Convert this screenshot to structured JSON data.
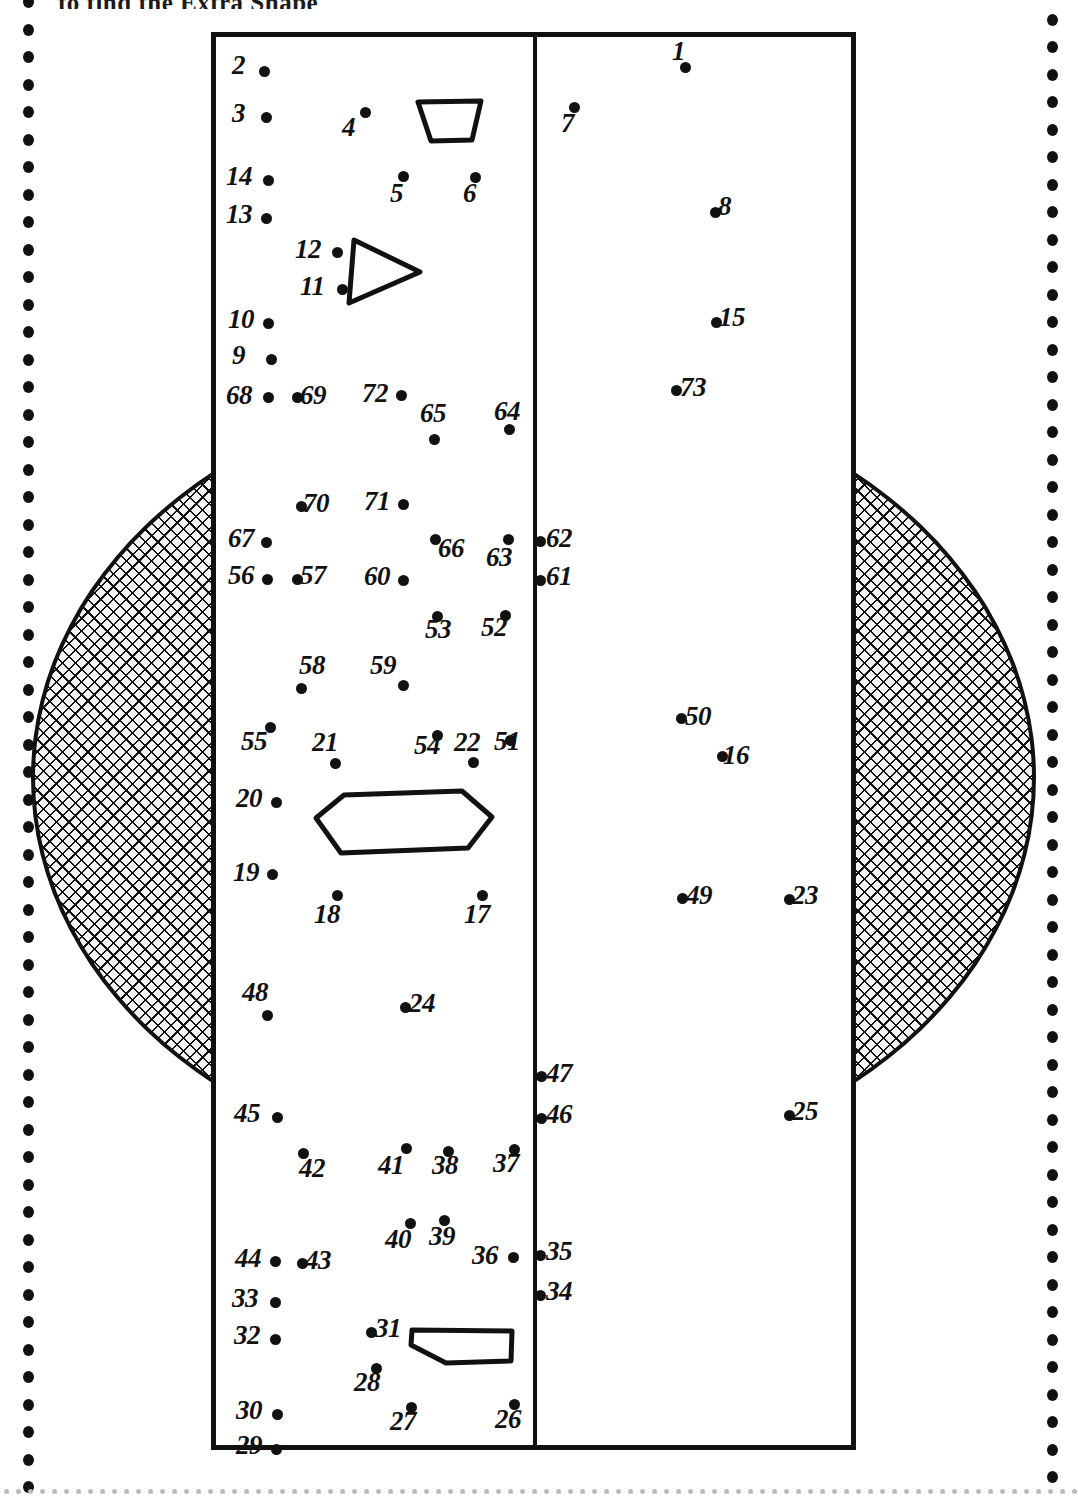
{
  "page": {
    "top_partial_heading": "to find the Extra Shape",
    "ink_color": "#111111",
    "paper_color": "#ffffff",
    "hatch_fill_color": "#f4f4f4"
  },
  "puzzle": {
    "type": "connect-the-dots",
    "frame": {
      "x": 211,
      "y": 32,
      "width": 645,
      "height": 1418,
      "divider_x": 533
    },
    "hatched_ellipse": {
      "cx": 533,
      "cy": 778,
      "rx": 503,
      "ry": 398
    },
    "dot_count": 73,
    "dots": [
      {
        "n": "1",
        "px": 680,
        "py": 62,
        "lx": 672,
        "ly": 36
      },
      {
        "n": "2",
        "px": 259,
        "py": 66,
        "lx": 232,
        "ly": 50
      },
      {
        "n": "3",
        "px": 261,
        "py": 112,
        "lx": 232,
        "ly": 98
      },
      {
        "n": "4",
        "px": 360,
        "py": 107,
        "lx": 342,
        "ly": 112
      },
      {
        "n": "5",
        "px": 398,
        "py": 171,
        "lx": 390,
        "ly": 178
      },
      {
        "n": "6",
        "px": 470,
        "py": 172,
        "lx": 463,
        "ly": 178
      },
      {
        "n": "7",
        "px": 569,
        "py": 102,
        "lx": 561,
        "ly": 108
      },
      {
        "n": "8",
        "px": 710,
        "py": 207,
        "lx": 718,
        "ly": 191
      },
      {
        "n": "9",
        "px": 266,
        "py": 354,
        "lx": 232,
        "ly": 340
      },
      {
        "n": "10",
        "px": 263,
        "py": 318,
        "lx": 228,
        "ly": 304
      },
      {
        "n": "11",
        "px": 337,
        "py": 284,
        "lx": 300,
        "ly": 271
      },
      {
        "n": "12",
        "px": 332,
        "py": 247,
        "lx": 295,
        "ly": 234
      },
      {
        "n": "13",
        "px": 261,
        "py": 213,
        "lx": 226,
        "ly": 199
      },
      {
        "n": "14",
        "px": 263,
        "py": 175,
        "lx": 226,
        "ly": 161
      },
      {
        "n": "15",
        "px": 711,
        "py": 317,
        "lx": 719,
        "ly": 302
      },
      {
        "n": "16",
        "px": 717,
        "py": 751,
        "lx": 723,
        "ly": 740
      },
      {
        "n": "17",
        "px": 477,
        "py": 890,
        "lx": 464,
        "ly": 899
      },
      {
        "n": "18",
        "px": 332,
        "py": 890,
        "lx": 314,
        "ly": 899
      },
      {
        "n": "19",
        "px": 267,
        "py": 869,
        "lx": 233,
        "ly": 857
      },
      {
        "n": "20",
        "px": 271,
        "py": 797,
        "lx": 236,
        "ly": 783
      },
      {
        "n": "21",
        "px": 330,
        "py": 758,
        "lx": 312,
        "ly": 727
      },
      {
        "n": "22",
        "px": 468,
        "py": 757,
        "lx": 454,
        "ly": 727
      },
      {
        "n": "23",
        "px": 784,
        "py": 894,
        "lx": 792,
        "ly": 880
      },
      {
        "n": "24",
        "px": 400,
        "py": 1002,
        "lx": 409,
        "ly": 988
      },
      {
        "n": "25",
        "px": 784,
        "py": 1110,
        "lx": 792,
        "ly": 1096
      },
      {
        "n": "26",
        "px": 509,
        "py": 1399,
        "lx": 495,
        "ly": 1404
      },
      {
        "n": "27",
        "px": 406,
        "py": 1402,
        "lx": 390,
        "ly": 1406
      },
      {
        "n": "28",
        "px": 371,
        "py": 1363,
        "lx": 354,
        "ly": 1367
      },
      {
        "n": "29",
        "px": 271,
        "py": 1444,
        "lx": 236,
        "ly": 1430
      },
      {
        "n": "30",
        "px": 272,
        "py": 1409,
        "lx": 236,
        "ly": 1395
      },
      {
        "n": "31",
        "px": 366,
        "py": 1327,
        "lx": 375,
        "ly": 1313
      },
      {
        "n": "32",
        "px": 270,
        "py": 1334,
        "lx": 234,
        "ly": 1320
      },
      {
        "n": "33",
        "px": 270,
        "py": 1297,
        "lx": 232,
        "ly": 1283
      },
      {
        "n": "34",
        "px": 535,
        "py": 1290,
        "lx": 546,
        "ly": 1276
      },
      {
        "n": "35",
        "px": 535,
        "py": 1250,
        "lx": 546,
        "ly": 1236
      },
      {
        "n": "36",
        "px": 508,
        "py": 1252,
        "lx": 472,
        "ly": 1240
      },
      {
        "n": "37",
        "px": 509,
        "py": 1144,
        "lx": 493,
        "ly": 1148
      },
      {
        "n": "38",
        "px": 443,
        "py": 1146,
        "lx": 432,
        "ly": 1150
      },
      {
        "n": "39",
        "px": 439,
        "py": 1215,
        "lx": 429,
        "ly": 1221
      },
      {
        "n": "40",
        "px": 405,
        "py": 1218,
        "lx": 385,
        "ly": 1224
      },
      {
        "n": "41",
        "px": 401,
        "py": 1143,
        "lx": 378,
        "ly": 1150
      },
      {
        "n": "42",
        "px": 298,
        "py": 1148,
        "lx": 299,
        "ly": 1153
      },
      {
        "n": "43",
        "px": 297,
        "py": 1258,
        "lx": 305,
        "ly": 1245
      },
      {
        "n": "44",
        "px": 270,
        "py": 1256,
        "lx": 235,
        "ly": 1243
      },
      {
        "n": "45",
        "px": 272,
        "py": 1112,
        "lx": 234,
        "ly": 1098
      },
      {
        "n": "46",
        "px": 536,
        "py": 1113,
        "lx": 546,
        "ly": 1099
      },
      {
        "n": "47",
        "px": 536,
        "py": 1071,
        "lx": 546,
        "ly": 1058
      },
      {
        "n": "48",
        "px": 262,
        "py": 1010,
        "lx": 242,
        "ly": 977
      },
      {
        "n": "49",
        "px": 677,
        "py": 893,
        "lx": 686,
        "ly": 880
      },
      {
        "n": "50",
        "px": 676,
        "py": 713,
        "lx": 685,
        "ly": 701
      },
      {
        "n": "51",
        "px": 505,
        "py": 735,
        "lx": 494,
        "ly": 726
      },
      {
        "n": "52",
        "px": 500,
        "py": 610,
        "lx": 481,
        "ly": 612
      },
      {
        "n": "53",
        "px": 432,
        "py": 611,
        "lx": 425,
        "ly": 614
      },
      {
        "n": "54",
        "px": 432,
        "py": 730,
        "lx": 414,
        "ly": 730
      },
      {
        "n": "55",
        "px": 265,
        "py": 722,
        "lx": 241,
        "ly": 726
      },
      {
        "n": "56",
        "px": 262,
        "py": 574,
        "lx": 228,
        "ly": 560
      },
      {
        "n": "57",
        "px": 292,
        "py": 574,
        "lx": 300,
        "ly": 560
      },
      {
        "n": "58",
        "px": 296,
        "py": 683,
        "lx": 299,
        "ly": 650
      },
      {
        "n": "59",
        "px": 398,
        "py": 680,
        "lx": 370,
        "ly": 650
      },
      {
        "n": "60",
        "px": 398,
        "py": 575,
        "lx": 364,
        "ly": 561
      },
      {
        "n": "61",
        "px": 535,
        "py": 575,
        "lx": 546,
        "ly": 561
      },
      {
        "n": "62",
        "px": 535,
        "py": 536,
        "lx": 546,
        "ly": 523
      },
      {
        "n": "63",
        "px": 503,
        "py": 534,
        "lx": 486,
        "ly": 542
      },
      {
        "n": "64",
        "px": 504,
        "py": 424,
        "lx": 494,
        "ly": 396
      },
      {
        "n": "65",
        "px": 429,
        "py": 434,
        "lx": 420,
        "ly": 398
      },
      {
        "n": "66",
        "px": 430,
        "py": 534,
        "lx": 438,
        "ly": 533
      },
      {
        "n": "67",
        "px": 261,
        "py": 537,
        "lx": 228,
        "ly": 523
      },
      {
        "n": "68",
        "px": 263,
        "py": 392,
        "lx": 226,
        "ly": 380
      },
      {
        "n": "69",
        "px": 292,
        "py": 392,
        "lx": 300,
        "ly": 380
      },
      {
        "n": "70",
        "px": 296,
        "py": 501,
        "lx": 303,
        "ly": 488
      },
      {
        "n": "71",
        "px": 398,
        "py": 499,
        "lx": 364,
        "ly": 486
      },
      {
        "n": "72",
        "px": 396,
        "py": 390,
        "lx": 362,
        "ly": 378
      },
      {
        "n": "73",
        "px": 671,
        "py": 385,
        "lx": 680,
        "ly": 372
      }
    ],
    "drawn_shapes": [
      {
        "name": "trapezoid-cup",
        "points": "418,102 481,101 472,140 431,141"
      },
      {
        "name": "right-triangle",
        "points": "354,240 420,272 349,303"
      },
      {
        "name": "octagon-oblong",
        "points": "316,818 344,795 462,791 492,817 468,848 341,853"
      },
      {
        "name": "boat-quadrilateral",
        "points": "412,1330 512,1331 511,1361 446,1363 411,1345"
      }
    ]
  }
}
